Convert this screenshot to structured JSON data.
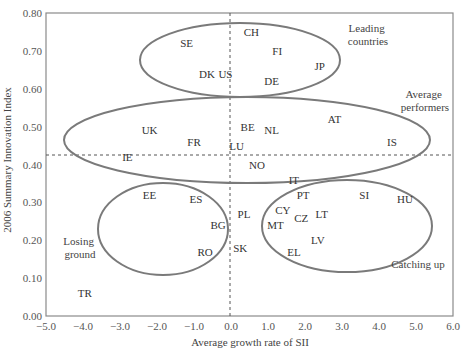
{
  "chart_data": {
    "type": "scatter",
    "title": "",
    "xlabel": "Average growth rate of SII",
    "ylabel": "2006 Summary Innovation Index",
    "xlim": [
      -5.0,
      6.0
    ],
    "ylim": [
      0.0,
      0.8
    ],
    "x_ticks": [
      "−5.0",
      "−4.0",
      "−3.0",
      "−2.0",
      "−1.0",
      "0.0",
      "1.0",
      "2.0",
      "3.0",
      "4.0",
      "5.0",
      "6.0"
    ],
    "y_ticks": [
      "0.00",
      "0.10",
      "0.20",
      "0.30",
      "0.40",
      "0.50",
      "0.60",
      "0.70",
      "0.80"
    ],
    "grid": false,
    "reference_lines": {
      "vertical_x": 0.0,
      "horizontal_y": 0.425,
      "style": "dashed"
    },
    "points": [
      {
        "label": "SE",
        "x": -1.2,
        "y": 0.72
      },
      {
        "label": "CH",
        "x": 0.55,
        "y": 0.75
      },
      {
        "label": "FI",
        "x": 1.25,
        "y": 0.7
      },
      {
        "label": "JP",
        "x": 2.4,
        "y": 0.66
      },
      {
        "label": "DK",
        "x": -0.65,
        "y": 0.64
      },
      {
        "label": "US",
        "x": -0.15,
        "y": 0.64
      },
      {
        "label": "DE",
        "x": 1.1,
        "y": 0.62
      },
      {
        "label": "UK",
        "x": -2.2,
        "y": 0.49
      },
      {
        "label": "FR",
        "x": -1.0,
        "y": 0.46
      },
      {
        "label": "BE",
        "x": 0.45,
        "y": 0.5
      },
      {
        "label": "NL",
        "x": 1.1,
        "y": 0.49
      },
      {
        "label": "AT",
        "x": 2.8,
        "y": 0.52
      },
      {
        "label": "IS",
        "x": 4.35,
        "y": 0.46
      },
      {
        "label": "LU",
        "x": 0.15,
        "y": 0.45
      },
      {
        "label": "IE",
        "x": -2.8,
        "y": 0.42
      },
      {
        "label": "NO",
        "x": 0.7,
        "y": 0.4
      },
      {
        "label": "IT",
        "x": 1.7,
        "y": 0.36
      },
      {
        "label": "EE",
        "x": -2.2,
        "y": 0.32
      },
      {
        "label": "ES",
        "x": -0.95,
        "y": 0.31
      },
      {
        "label": "PT",
        "x": 1.95,
        "y": 0.32
      },
      {
        "label": "SI",
        "x": 3.6,
        "y": 0.32
      },
      {
        "label": "HU",
        "x": 4.7,
        "y": 0.31
      },
      {
        "label": "PL",
        "x": 0.35,
        "y": 0.27
      },
      {
        "label": "CY",
        "x": 1.4,
        "y": 0.28
      },
      {
        "label": "CZ",
        "x": 1.9,
        "y": 0.26
      },
      {
        "label": "LT",
        "x": 2.45,
        "y": 0.27
      },
      {
        "label": "BG",
        "x": -0.35,
        "y": 0.24
      },
      {
        "label": "MT",
        "x": 1.2,
        "y": 0.24
      },
      {
        "label": "LV",
        "x": 2.35,
        "y": 0.2
      },
      {
        "label": "SK",
        "x": 0.25,
        "y": 0.18
      },
      {
        "label": "RO",
        "x": -0.7,
        "y": 0.17
      },
      {
        "label": "EL",
        "x": 1.7,
        "y": 0.17
      },
      {
        "label": "TR",
        "x": -3.95,
        "y": 0.06
      }
    ],
    "groups": [
      {
        "name": "Leading countries",
        "label_lines": [
          "Leading",
          "countries"
        ],
        "members": [
          "SE",
          "CH",
          "FI",
          "JP",
          "DK",
          "US",
          "DE"
        ]
      },
      {
        "name": "Average performers",
        "label_lines": [
          "Average",
          "performers"
        ],
        "members": [
          "UK",
          "FR",
          "BE",
          "NL",
          "AT",
          "IS",
          "LU",
          "IE",
          "NO"
        ]
      },
      {
        "name": "Losing ground",
        "label_lines": [
          "Losing",
          "ground"
        ],
        "members": [
          "EE",
          "ES",
          "BG",
          "PL",
          "RO",
          "SK"
        ]
      },
      {
        "name": "Catching up",
        "label_lines": [
          "Catching up"
        ],
        "members": [
          "PT",
          "SI",
          "HU",
          "CY",
          "CZ",
          "LT",
          "MT",
          "LV",
          "EL",
          "IT"
        ]
      }
    ]
  }
}
